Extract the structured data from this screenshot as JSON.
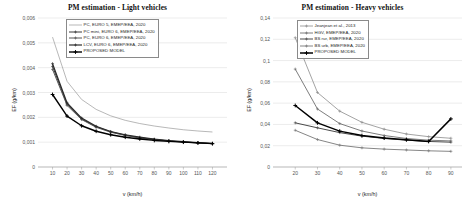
{
  "figure": {
    "panels": [
      "light",
      "heavy"
    ]
  },
  "chart_data": [
    {
      "type": "line",
      "panel_id": "light",
      "title": "PM estimation - Light vehicles",
      "xlabel": "v (km/h)",
      "ylabel": "EF (g/km)",
      "xlim": [
        0,
        130
      ],
      "ylim": [
        0,
        0.006
      ],
      "grid": true,
      "grid_axis": "y",
      "legend_position": "top-center",
      "xticks": [
        10,
        20,
        30,
        40,
        50,
        60,
        70,
        80,
        90,
        100,
        110,
        120
      ],
      "xtick_labels": [
        "10",
        "20",
        "30",
        "40",
        "50",
        "60",
        "70",
        "80",
        "90",
        "100",
        "110",
        "120"
      ],
      "yticks": [
        0,
        0.001,
        0.002,
        0.003,
        0.004,
        0.005,
        0.006
      ],
      "ytick_labels": [
        "0",
        "0,001",
        "0,002",
        "0,003",
        "0,004",
        "0,005",
        "0,006"
      ],
      "x": [
        10,
        20,
        30,
        40,
        50,
        60,
        70,
        80,
        90,
        100,
        110,
        120
      ],
      "series": [
        {
          "name": "PC, EURO 5, EMEP/EEA, 2020",
          "marker": "none",
          "color": "#9a9a9a",
          "width": 0.7,
          "values": [
            0.00523,
            0.00345,
            0.00272,
            0.00232,
            0.00206,
            0.00188,
            0.00175,
            0.00165,
            0.00157,
            0.0015,
            0.00145,
            0.00141
          ]
        },
        {
          "name": "PC mini, EURO 6, EMEP/EEA, 2020",
          "marker": "cross",
          "color": "#3a3a3a",
          "width": 1.0,
          "values": [
            0.00405,
            0.00253,
            0.00194,
            0.00162,
            0.00142,
            0.00128,
            0.00118,
            0.00111,
            0.00105,
            0.00101,
            0.00097,
            0.00094
          ]
        },
        {
          "name": "PC, EURO 6, EMEP/EEA, 2020",
          "marker": "cross",
          "color": "#555555",
          "width": 1.0,
          "values": [
            0.00393,
            0.00248,
            0.00191,
            0.0016,
            0.0014,
            0.00127,
            0.00117,
            0.0011,
            0.00105,
            0.001,
            0.00097,
            0.00094
          ]
        },
        {
          "name": "LCV, EURO 6, EMEP/EEA, 2020",
          "marker": "cross",
          "color": "#2a2a2a",
          "width": 1.2,
          "values": [
            0.00416,
            0.00258,
            0.00197,
            0.00164,
            0.00143,
            0.0013,
            0.0012,
            0.00112,
            0.00106,
            0.00102,
            0.00098,
            0.00095
          ]
        },
        {
          "name": "PROPOSED MODEL",
          "marker": "cross-bold",
          "color": "#000000",
          "width": 1.4,
          "values": [
            0.00292,
            0.00205,
            0.00166,
            0.00144,
            0.0013,
            0.0012,
            0.00113,
            0.00107,
            0.00103,
            0.001,
            0.00097,
            0.00094
          ]
        }
      ]
    },
    {
      "type": "line",
      "panel_id": "heavy",
      "title": "PM estimation - Heavy vehicles",
      "xlabel": "v (km/h)",
      "ylabel": "EF (g/km)",
      "xlim": [
        10,
        95
      ],
      "ylim": [
        0,
        0.14
      ],
      "grid": true,
      "grid_axis": "y",
      "legend_position": "top-center",
      "xticks": [
        20,
        30,
        40,
        50,
        60,
        70,
        80,
        90
      ],
      "xtick_labels": [
        "20",
        "30",
        "40",
        "50",
        "60",
        "70",
        "80",
        "90"
      ],
      "yticks": [
        0,
        0.02,
        0.04,
        0.06,
        0.08,
        0.1,
        0.12,
        0.14
      ],
      "ytick_labels": [
        "0",
        "0,02",
        "0,04",
        "0,06",
        "0,08",
        "0,1",
        "0,12",
        "0,14"
      ],
      "x": [
        20,
        30,
        40,
        50,
        60,
        70,
        80,
        90
      ],
      "series": [
        {
          "name": "Jeanjean et al., 2013",
          "marker": "cross",
          "color": "#8c8c8c",
          "width": 0.8,
          "values": [
            0.1215,
            0.07,
            0.0525,
            0.042,
            0.0355,
            0.031,
            0.0285,
            0.027
          ]
        },
        {
          "name": "HGV, EMEP/EEA, 2020",
          "marker": "cross",
          "color": "#6e6e6e",
          "width": 0.9,
          "values": [
            0.092,
            0.0545,
            0.0408,
            0.0338,
            0.0296,
            0.0268,
            0.0252,
            0.0245
          ]
        },
        {
          "name": "BS rur, EMEP/EEA, 2020",
          "marker": "cross",
          "color": "#4a4a4a",
          "width": 1.0,
          "values": [
            0.0415,
            0.0368,
            0.0323,
            0.029,
            0.0268,
            0.0252,
            0.024,
            0.0233
          ]
        },
        {
          "name": "BS urb, EMEP/EEA, 2020",
          "marker": "cross",
          "color": "#777777",
          "width": 0.9,
          "values": [
            0.0345,
            0.0258,
            0.0205,
            0.018,
            0.0168,
            0.016,
            0.0152,
            0.0147
          ]
        },
        {
          "name": "PROPOSED MODEL",
          "marker": "cross-bold",
          "color": "#000000",
          "width": 1.5,
          "values": [
            0.0578,
            0.0415,
            0.0337,
            0.0295,
            0.0272,
            0.0256,
            0.024,
            0.0452
          ]
        }
      ]
    }
  ]
}
